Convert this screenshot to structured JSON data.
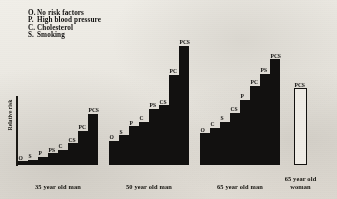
{
  "chart_data": {
    "type": "bar",
    "title": "",
    "xlabel": "",
    "ylabel": "Relative risk",
    "grid": false,
    "legend_position": "top-left",
    "axis_note": "Vertical axis line at left, no numeric tick labels; unitless relative risk scale.",
    "legend": [
      {
        "key": "O.",
        "label": "No risk factors"
      },
      {
        "key": "P.",
        "label": "High blood pressure"
      },
      {
        "key": "C.",
        "label": "Cholesterol"
      },
      {
        "key": "S.",
        "label": "Smoking"
      }
    ],
    "categories": [
      "35 year old man",
      "50 year old man",
      "65 year old man",
      "65 year old woman"
    ],
    "groups": [
      {
        "name": "35 year old man",
        "xlabel": "35 year old man",
        "filled": true,
        "bars": [
          {
            "label": "O",
            "value": 4
          },
          {
            "label": "S",
            "value": 6
          },
          {
            "label": "P",
            "value": 9
          },
          {
            "label": "PS",
            "value": 13
          },
          {
            "label": "C",
            "value": 17
          },
          {
            "label": "CS",
            "value": 24
          },
          {
            "label": "PC",
            "value": 38
          },
          {
            "label": "PCS",
            "value": 57
          }
        ]
      },
      {
        "name": "50 year old man",
        "xlabel": "50 year old man",
        "filled": true,
        "bars": [
          {
            "label": "O",
            "value": 27
          },
          {
            "label": "S",
            "value": 33
          },
          {
            "label": "P",
            "value": 43
          },
          {
            "label": "C",
            "value": 48
          },
          {
            "label": "PS",
            "value": 62
          },
          {
            "label": "CS",
            "value": 66
          },
          {
            "label": "PC",
            "value": 100
          },
          {
            "label": "PCS",
            "value": 132
          }
        ]
      },
      {
        "name": "65 year old man",
        "xlabel": "65 year old man",
        "filled": true,
        "bars": [
          {
            "label": "O",
            "value": 35
          },
          {
            "label": "C",
            "value": 41
          },
          {
            "label": "S",
            "value": 48
          },
          {
            "label": "CS",
            "value": 58
          },
          {
            "label": "P",
            "value": 72
          },
          {
            "label": "PC",
            "value": 88
          },
          {
            "label": "PS",
            "value": 101
          },
          {
            "label": "PCS",
            "value": 117
          }
        ]
      },
      {
        "name": "65 year old woman",
        "xlabel": "65 year old\nwoman",
        "filled": false,
        "bars": [
          {
            "label": "PCS",
            "value": 85
          }
        ]
      }
    ],
    "ylim": [
      0,
      145
    ]
  }
}
